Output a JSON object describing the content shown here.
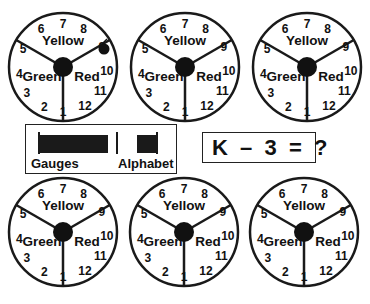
{
  "gauges": [
    {
      "id": "gauge-1",
      "cx": 63,
      "cy": 67,
      "marker": {
        "position": 9,
        "x": 104,
        "y": 49,
        "r": 5.5
      }
    },
    {
      "id": "gauge-2",
      "cx": 185,
      "cy": 67,
      "marker": null
    },
    {
      "id": "gauge-3",
      "cx": 307,
      "cy": 67,
      "marker": null
    },
    {
      "id": "gauge-4",
      "cx": 63,
      "cy": 232,
      "marker": null
    },
    {
      "id": "gauge-5",
      "cx": 184,
      "cy": 232,
      "marker": null
    },
    {
      "id": "gauge-6",
      "cx": 304,
      "cy": 232,
      "marker": null
    }
  ],
  "gauge_common": {
    "radius": 54,
    "hub_radius": 10,
    "numbers": [
      "1",
      "2",
      "3",
      "4",
      "5",
      "6",
      "7",
      "8",
      "9",
      "10",
      "11",
      "12"
    ],
    "zones": {
      "top": "Yellow",
      "left": "Green",
      "right": "Red"
    }
  },
  "legend_panel": {
    "gauges_label": "Gauges",
    "alphabet_label": "Alphabet"
  },
  "equation": {
    "text": "K  –  3  =  ?"
  },
  "colors": {
    "ink": "#111111",
    "background": "#ffffff"
  }
}
